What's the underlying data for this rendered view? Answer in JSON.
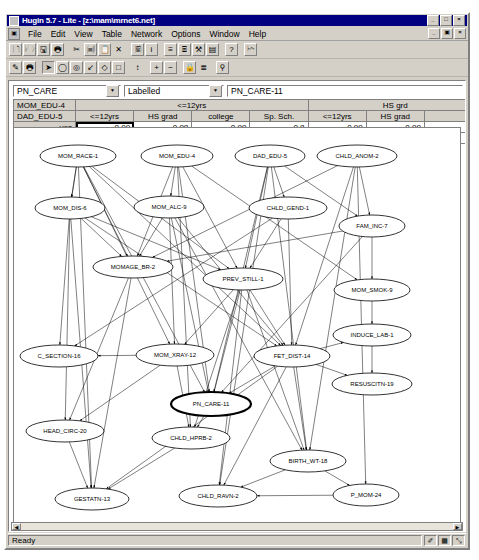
{
  "window": {
    "title": "Hugin 5.7 - Lite - [z:\\mam\\mrnet6.net]",
    "sys_icon": "hugin-icon",
    "controls": [
      {
        "name": "minimize-button",
        "glyph": "_"
      },
      {
        "name": "maximize-button",
        "glyph": "□"
      },
      {
        "name": "close-button",
        "glyph": "×"
      }
    ],
    "mdi_controls": [
      {
        "name": "mdi-minimize-button",
        "glyph": "_"
      },
      {
        "name": "mdi-restore-button",
        "glyph": "▣"
      },
      {
        "name": "mdi-close-button",
        "glyph": "×"
      }
    ]
  },
  "menu": {
    "doc_icon": "document-icon",
    "items": [
      {
        "label": "File"
      },
      {
        "label": "Edit"
      },
      {
        "label": "View"
      },
      {
        "label": "Table"
      },
      {
        "label": "Network"
      },
      {
        "label": "Options"
      },
      {
        "label": "Window"
      },
      {
        "label": "Help"
      }
    ]
  },
  "toolbar_top": [
    {
      "name": "new-file-button",
      "icon": "new-document-icon",
      "state": "raised"
    },
    {
      "name": "open-file-button",
      "icon": "open-folder-icon",
      "state": "raised"
    },
    {
      "name": "save-file-button",
      "icon": "floppy-disk-icon",
      "state": "raised"
    },
    {
      "name": "print-button",
      "icon": "printer-icon",
      "state": "raised"
    },
    {
      "name": "sep1",
      "icon": "separator",
      "state": "sep"
    },
    {
      "name": "cut-button",
      "icon": "scissors-icon",
      "state": "flat"
    },
    {
      "name": "copy-button",
      "icon": "copy-pages-icon",
      "state": "raised"
    },
    {
      "name": "paste-button",
      "icon": "clipboard-icon",
      "state": "raised"
    },
    {
      "name": "delete-button",
      "icon": "delete-x-icon",
      "state": "flat"
    },
    {
      "name": "sep2",
      "icon": "separator",
      "state": "sep"
    },
    {
      "name": "network-properties-button",
      "icon": "network-props-icon",
      "state": "raised"
    },
    {
      "name": "node-info-button",
      "icon": "info-i-icon",
      "state": "raised"
    },
    {
      "name": "sep3",
      "icon": "separator",
      "state": "sep"
    },
    {
      "name": "show-tables-button",
      "icon": "table-rows-icon",
      "state": "raised"
    },
    {
      "name": "show-node-table-button",
      "icon": "table-column-icon",
      "state": "raised"
    },
    {
      "name": "compile-button",
      "icon": "compile-wrench-icon",
      "state": "raised"
    },
    {
      "name": "monitor-windows-button",
      "icon": "window-panes-icon",
      "state": "raised"
    },
    {
      "name": "sep4",
      "icon": "separator",
      "state": "sep"
    },
    {
      "name": "help-button",
      "icon": "question-mark-icon",
      "state": "raised"
    },
    {
      "name": "sep5",
      "icon": "separator",
      "state": "sep"
    },
    {
      "name": "run-mode-button",
      "icon": "lightning-run-icon",
      "state": "raised"
    }
  ],
  "toolbar_bottom": [
    {
      "name": "edit-mode-button",
      "icon": "pencil-edit-icon",
      "state": "raised"
    },
    {
      "name": "run-propagate-button",
      "icon": "propagate-icon",
      "state": "raised"
    },
    {
      "name": "sep1",
      "icon": "separator",
      "state": "sep"
    },
    {
      "name": "select-tool-button",
      "icon": "arrow-cursor-icon",
      "state": "pressed"
    },
    {
      "name": "discrete-chance-node-button",
      "icon": "ellipse-node-icon",
      "state": "raised"
    },
    {
      "name": "continuous-chance-node-button",
      "icon": "double-ellipse-node-icon",
      "state": "raised"
    },
    {
      "name": "link-tool-button",
      "icon": "arrow-link-icon",
      "state": "raised"
    },
    {
      "name": "decision-node-button",
      "icon": "diamond-node-icon",
      "state": "raised"
    },
    {
      "name": "utility-node-button",
      "icon": "square-node-icon",
      "state": "raised"
    },
    {
      "name": "sep2",
      "icon": "separator",
      "state": "sep"
    },
    {
      "name": "align-button",
      "icon": "align-icon",
      "state": "flat"
    },
    {
      "name": "sep3",
      "icon": "separator",
      "state": "sep"
    },
    {
      "name": "zoom-in-button",
      "icon": "plus-icon",
      "state": "raised"
    },
    {
      "name": "zoom-out-button",
      "icon": "minus-icon",
      "state": "raised"
    },
    {
      "name": "sep4",
      "icon": "separator",
      "state": "sep"
    },
    {
      "name": "lock-network-button",
      "icon": "padlock-icon",
      "state": "raised"
    },
    {
      "name": "list-view-button",
      "icon": "list-lines-icon",
      "state": "flat"
    },
    {
      "name": "sep5",
      "icon": "separator",
      "state": "sep"
    },
    {
      "name": "magnify-button",
      "icon": "magnifier-icon",
      "state": "raised"
    }
  ],
  "node_selector": {
    "node_combo_value": "PN_CARE",
    "display_mode_value": "Labelled",
    "node_name_value": "PN_CARE-11",
    "dropdown_arrow": "chevron-down-icon"
  },
  "cpt": {
    "parent_rows": [
      {
        "label": "MOM_EDU-4"
      },
      {
        "label": "DAD_EDU-5"
      }
    ],
    "mom_edu_groups": [
      {
        "label": "<=12yrs",
        "span": 4
      },
      {
        "label": "HS grd",
        "span": 3
      }
    ],
    "dad_edu_headers": [
      "<=12yrs",
      "HS grad",
      "college",
      "Sp. Sch.",
      "<=12yrs",
      "HS grad",
      ""
    ],
    "states": [
      "yes",
      "none"
    ],
    "values": [
      [
        "0.99",
        "0.98",
        "0.99",
        "0.8",
        "0.99",
        "0.99",
        ""
      ],
      [
        "0.01",
        "0.02",
        "0.01",
        "0.2",
        "0.02",
        "0.01",
        ""
      ]
    ],
    "selected_cell": {
      "row": 0,
      "col": 0
    }
  },
  "graph": {
    "nodes": [
      {
        "id": "MOM_RACE-1",
        "label": "MOM_RACE-1",
        "x": 64,
        "y": 28,
        "rx": 38,
        "ry": 11,
        "selected": false
      },
      {
        "id": "MOM_EDU-4",
        "label": "MOM_EDU-4",
        "x": 163,
        "y": 28,
        "rx": 36,
        "ry": 11,
        "selected": false
      },
      {
        "id": "DAD_EDU-5",
        "label": "DAD_EDU-5",
        "x": 256,
        "y": 28,
        "rx": 35,
        "ry": 11,
        "selected": false
      },
      {
        "id": "CHLD_ANOM-2",
        "label": "CHLD_ANOM-2",
        "x": 343,
        "y": 28,
        "rx": 40,
        "ry": 11,
        "selected": false
      },
      {
        "id": "MOM_DIS-6",
        "label": "MOM_DIS-6",
        "x": 56,
        "y": 80,
        "rx": 35,
        "ry": 11,
        "selected": false
      },
      {
        "id": "MOM_ALC-9",
        "label": "MOM_ALC-9",
        "x": 155,
        "y": 79,
        "rx": 35,
        "ry": 11,
        "selected": false
      },
      {
        "id": "CHLD_GEND-1",
        "label": "CHLD_GEND-1",
        "x": 274,
        "y": 80,
        "rx": 39,
        "ry": 11,
        "selected": false
      },
      {
        "id": "FAM_INC-7",
        "label": "FAM_INC-7",
        "x": 358,
        "y": 98,
        "rx": 33,
        "ry": 11,
        "selected": false
      },
      {
        "id": "MOMAGE_BR-2",
        "label": "MOMAGE_BR-2",
        "x": 119,
        "y": 139,
        "rx": 40,
        "ry": 11,
        "selected": false
      },
      {
        "id": "PREV_STILL-1",
        "label": "PREV_STILL-1",
        "x": 229,
        "y": 151,
        "rx": 40,
        "ry": 11,
        "selected": false
      },
      {
        "id": "MOM_SMOK-9",
        "label": "MOM_SMOK-9",
        "x": 358,
        "y": 162,
        "rx": 38,
        "ry": 11,
        "selected": false
      },
      {
        "id": "INDUCE_LAB-1",
        "label": "INDUCE_LAB-1",
        "x": 358,
        "y": 207,
        "rx": 39,
        "ry": 11,
        "selected": false
      },
      {
        "id": "C_SECTION-16",
        "label": "C_SECTION-16",
        "x": 45,
        "y": 228,
        "rx": 39,
        "ry": 11,
        "selected": false
      },
      {
        "id": "MOM_XRAY-12",
        "label": "MOM_XRAY-12",
        "x": 161,
        "y": 227,
        "rx": 39,
        "ry": 11,
        "selected": false
      },
      {
        "id": "FET_DIST-14",
        "label": "FET_DIST-14",
        "x": 278,
        "y": 228,
        "rx": 38,
        "ry": 11,
        "selected": false
      },
      {
        "id": "RESUSCITN-19",
        "label": "RESUSCITN-19",
        "x": 358,
        "y": 256,
        "rx": 40,
        "ry": 11,
        "selected": false
      },
      {
        "id": "PN_CARE-11",
        "label": "PN_CARE-11",
        "x": 197,
        "y": 276,
        "rx": 40,
        "ry": 12,
        "selected": true
      },
      {
        "id": "HEAD_CIRC-20",
        "label": "HEAD_CIRC-20",
        "x": 51,
        "y": 303,
        "rx": 39,
        "ry": 11,
        "selected": false
      },
      {
        "id": "CHLD_HPRB-2",
        "label": "CHLD_HPRB-2",
        "x": 177,
        "y": 310,
        "rx": 39,
        "ry": 11,
        "selected": false
      },
      {
        "id": "BIRTH_WT-18",
        "label": "BIRTH_WT-18",
        "x": 294,
        "y": 333,
        "rx": 38,
        "ry": 11,
        "selected": false
      },
      {
        "id": "GESTATN-13",
        "label": "GESTATN-13",
        "x": 78,
        "y": 371,
        "rx": 37,
        "ry": 11,
        "selected": false
      },
      {
        "id": "CHLD_RAVN-2",
        "label": "CHLD_RAVN-2",
        "x": 204,
        "y": 368,
        "rx": 39,
        "ry": 11,
        "selected": false
      },
      {
        "id": "P_MOM-24",
        "label": "P_MOM-24",
        "x": 352,
        "y": 367,
        "rx": 33,
        "ry": 11,
        "selected": false
      }
    ],
    "edges": [
      [
        "MOM_RACE-1",
        "MOM_DIS-6"
      ],
      [
        "MOM_RACE-1",
        "MOM_DIS-6"
      ],
      [
        "MOM_RACE-1",
        "MOMAGE_BR-2"
      ],
      [
        "MOM_RACE-1",
        "MOM_XRAY-12"
      ],
      [
        "MOM_RACE-1",
        "PREV_STILL-1"
      ],
      [
        "MOM_RACE-1",
        "FET_DIST-14"
      ],
      [
        "MOM_RACE-1",
        "PN_CARE-11"
      ],
      [
        "MOM_RACE-1",
        "GESTATN-13"
      ],
      [
        "MOM_EDU-4",
        "MOM_ALC-9"
      ],
      [
        "MOM_EDU-4",
        "MOMAGE_BR-2"
      ],
      [
        "MOM_EDU-4",
        "PN_CARE-11"
      ],
      [
        "MOM_EDU-4",
        "PREV_STILL-1"
      ],
      [
        "MOM_EDU-4",
        "MOM_SMOK-9"
      ],
      [
        "MOM_EDU-4",
        "CHLD_HPRB-2"
      ],
      [
        "DAD_EDU-5",
        "PREV_STILL-1"
      ],
      [
        "DAD_EDU-5",
        "PN_CARE-11"
      ],
      [
        "DAD_EDU-5",
        "FAM_INC-7"
      ],
      [
        "DAD_EDU-5",
        "CHLD_GEND-1"
      ],
      [
        "DAD_EDU-5",
        "CHLD_RAVN-2"
      ],
      [
        "CHLD_ANOM-2",
        "FAM_INC-7"
      ],
      [
        "CHLD_ANOM-2",
        "FET_DIST-14"
      ],
      [
        "CHLD_ANOM-2",
        "MOMAGE_BR-2"
      ],
      [
        "CHLD_ANOM-2",
        "BIRTH_WT-18"
      ],
      [
        "MOM_DIS-6",
        "C_SECTION-16"
      ],
      [
        "MOM_DIS-6",
        "HEAD_CIRC-20"
      ],
      [
        "MOM_DIS-6",
        "GESTATN-13"
      ],
      [
        "MOM_DIS-6",
        "MOMAGE_BR-2"
      ],
      [
        "MOM_DIS-6",
        "FET_DIST-14"
      ],
      [
        "MOM_DIS-6",
        "PREV_STILL-1"
      ],
      [
        "MOM_ALC-9",
        "MOMAGE_BR-2"
      ],
      [
        "MOM_ALC-9",
        "MOM_XRAY-12"
      ],
      [
        "MOM_ALC-9",
        "PN_CARE-11"
      ],
      [
        "MOM_ALC-9",
        "FET_DIST-14"
      ],
      [
        "MOM_ALC-9",
        "BIRTH_WT-18"
      ],
      [
        "CHLD_GEND-1",
        "FET_DIST-14"
      ],
      [
        "CHLD_GEND-1",
        "C_SECTION-16"
      ],
      [
        "CHLD_GEND-1",
        "PREV_STILL-1"
      ],
      [
        "FAM_INC-7",
        "MOM_SMOK-9"
      ],
      [
        "FAM_INC-7",
        "MOMAGE_BR-2"
      ],
      [
        "FAM_INC-7",
        "PN_CARE-11"
      ],
      [
        "MOMAGE_BR-2",
        "HEAD_CIRC-20"
      ],
      [
        "MOMAGE_BR-2",
        "GESTATN-13"
      ],
      [
        "PREV_STILL-1",
        "PN_CARE-11"
      ],
      [
        "PREV_STILL-1",
        "FET_DIST-14"
      ],
      [
        "PREV_STILL-1",
        "CHLD_HPRB-2"
      ],
      [
        "PREV_STILL-1",
        "CHLD_RAVN-2"
      ],
      [
        "PREV_STILL-1",
        "BIRTH_WT-18"
      ],
      [
        "PREV_STILL-1",
        "MOM_XRAY-12"
      ],
      [
        "MOM_SMOK-9",
        "INDUCE_LAB-1"
      ],
      [
        "INDUCE_LAB-1",
        "RESUSCITN-19"
      ],
      [
        "MOM_XRAY-12",
        "C_SECTION-16"
      ],
      [
        "MOM_XRAY-12",
        "CHLD_HPRB-2"
      ],
      [
        "MOM_XRAY-12",
        "HEAD_CIRC-20"
      ],
      [
        "FET_DIST-14",
        "INDUCE_LAB-1"
      ],
      [
        "FET_DIST-14",
        "RESUSCITN-19"
      ],
      [
        "FET_DIST-14",
        "CHLD_RAVN-2"
      ],
      [
        "FET_DIST-14",
        "BIRTH_WT-18"
      ],
      [
        "FET_DIST-14",
        "GESTATN-13"
      ],
      [
        "FET_DIST-14",
        "PN_CARE-11"
      ],
      [
        "PN_CARE-11",
        "CHLD_HPRB-2"
      ],
      [
        "HEAD_CIRC-20",
        "GESTATN-13"
      ],
      [
        "CHLD_HPRB-2",
        "GESTATN-13"
      ],
      [
        "BIRTH_WT-18",
        "CHLD_RAVN-2"
      ],
      [
        "BIRTH_WT-18",
        "P_MOM-24"
      ],
      [
        "P_MOM-24",
        "CHLD_RAVN-2"
      ],
      [
        "CHLD_ANOM-2",
        "P_MOM-24"
      ],
      [
        "DAD_EDU-5",
        "BIRTH_WT-18"
      ]
    ]
  },
  "statusbar": {
    "message": "Ready",
    "indicators": [
      {
        "name": "edit-indicator",
        "glyph": "✐"
      },
      {
        "name": "grid-indicator",
        "glyph": "▦"
      },
      {
        "name": "snap-indicator",
        "glyph": "⤡"
      }
    ]
  }
}
